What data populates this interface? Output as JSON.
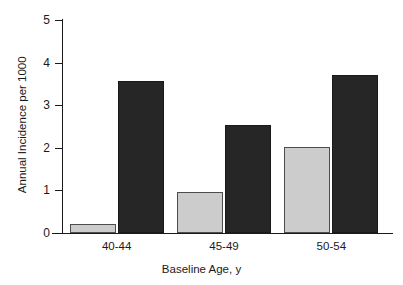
{
  "chart_data": {
    "type": "bar",
    "title": "",
    "subtitle": "",
    "xlabel": "Baseline Age, y",
    "ylabel": "Annual Incidence per 1000",
    "categories": [
      "40-44",
      "45-49",
      "50-54"
    ],
    "series": [
      {
        "name": "light-series",
        "color": "#cccccc",
        "values": [
          0.2,
          0.97,
          2.02
        ]
      },
      {
        "name": "dark-series",
        "color": "#262626",
        "values": [
          3.57,
          2.53,
          3.7
        ]
      }
    ],
    "ylim": [
      0,
      5
    ],
    "yticks": [
      0,
      1,
      2,
      3,
      4,
      5
    ],
    "ytick_labels": [
      "0",
      "1",
      "2",
      "3",
      "4",
      "5"
    ],
    "xlim_categories": 3,
    "grid": false,
    "legend": "none",
    "spines": {
      "left": true,
      "bottom": true,
      "top": false,
      "right": false
    },
    "axis_color": "#1a1a1a",
    "background": "#ffffff"
  }
}
